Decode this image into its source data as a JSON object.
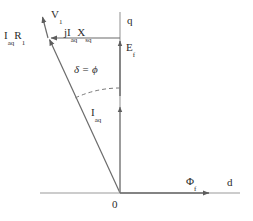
{
  "figure": {
    "type": "phasor-diagram",
    "background_color": "#ffffff",
    "line_color": "#6b6b6b",
    "text_color": "#2b2b2b"
  },
  "axes": {
    "q_axis_label": "q",
    "d_axis_label": "d",
    "origin_label": "0",
    "q_axis": {
      "x": 120,
      "y_top": 12,
      "y_bottom": 193
    },
    "d_axis": {
      "y": 193,
      "x_left": 40,
      "x_right": 240,
      "arrow_x": 212
    }
  },
  "vectors": [
    {
      "id": "v1",
      "label": "V",
      "subscript": "1",
      "description": "terminal voltage phasor",
      "from": [
        120,
        193
      ],
      "to": [
        48,
        38
      ],
      "arrow": "head-at-to"
    },
    {
      "id": "iaq-r1",
      "label": "I",
      "subscript": "aq",
      "label2": "R",
      "subscript2": "1",
      "description": "armature resistance voltage drop",
      "from": [
        48,
        38
      ],
      "to": [
        42,
        14
      ],
      "arrow": "head-at-to"
    },
    {
      "id": "jiaq-xsq",
      "label": "jI",
      "subscript": "aq",
      "label2": "X",
      "subscript2": "sq",
      "description": "quadrature reactance voltage drop",
      "from": [
        120,
        38
      ],
      "to": [
        48,
        38
      ],
      "arrow": "head-at-to"
    },
    {
      "id": "ef",
      "label": "E",
      "subscript": "f",
      "description": "excitation emf along q-axis",
      "from": [
        120,
        96
      ],
      "to": [
        120,
        38
      ],
      "arrow": "head-at-to"
    },
    {
      "id": "iaq",
      "label": "I",
      "subscript": "aq",
      "description": "quadrature axis armature current",
      "from": [
        120,
        193
      ],
      "to": [
        120,
        104
      ],
      "arrow": "head-at-to"
    },
    {
      "id": "phif",
      "label": "Φ",
      "subscript": "f",
      "description": "field flux along d-axis",
      "from": [
        120,
        193
      ],
      "to": [
        212,
        193
      ],
      "arrow": "head-at-to"
    }
  ],
  "angle_annotation": {
    "text": "δ = ϕ",
    "delta_symbol": "δ",
    "equals": "=",
    "phi_symbol": "ϕ",
    "description": "angle between terminal voltage phasor and q-axis, dashed arc",
    "arc": {
      "cx": 120,
      "cy": 193,
      "r": 105,
      "start_deg": 90,
      "end_deg": 115
    }
  },
  "labels": {
    "iaq_r1": {
      "main": "I",
      "sub": "aq",
      "main2": "R",
      "sub2": "1"
    },
    "v1": {
      "main": "V",
      "sub": "1"
    },
    "jiaq_xsq": {
      "main": "jI",
      "sub": "aq",
      "main2": "X",
      "sub2": "sq"
    },
    "q": "q",
    "ef": {
      "main": "E",
      "sub": "f"
    },
    "delta_phi": "δ = ϕ",
    "iaq": {
      "main": "I",
      "sub": "aq"
    },
    "phi_f": {
      "main": "Φ",
      "sub": "f"
    },
    "d": "d",
    "origin": "0"
  }
}
